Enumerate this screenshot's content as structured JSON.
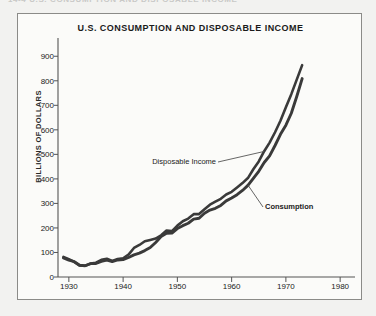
{
  "page": {
    "clipped_header_text": "14-4   U.S. CONSUMPTION AND DISPOSABLE INCOME",
    "background_color": "#f2f2f0",
    "panel_color": "#fbfbf9",
    "frame_color": "#8b8b88",
    "ink_color": "#3a3a3a"
  },
  "chart_data": {
    "type": "line",
    "title": "U.S. CONSUMPTION AND DISPOSABLE INCOME",
    "xlabel": "",
    "ylabel": "BILLIONS OF DOLLARS",
    "xlim": [
      1928,
      1982
    ],
    "ylim": [
      0,
      950
    ],
    "grid": false,
    "legend_position": "inline-annotations",
    "xticks": [
      1930,
      1940,
      1950,
      1960,
      1970,
      1980
    ],
    "xtick_labels": [
      "1930",
      "1940",
      "1950",
      "1960",
      "1970",
      "1980"
    ],
    "yticks": [
      0,
      100,
      200,
      300,
      400,
      500,
      600,
      700,
      800,
      900
    ],
    "ytick_labels": [
      "0",
      "100",
      "200",
      "300",
      "400",
      "500",
      "600",
      "700",
      "800",
      "900"
    ],
    "annotations": [
      {
        "text": "Disposable Income",
        "series": "Disposable Income",
        "bold": false
      },
      {
        "text": "Consumption",
        "series": "Consumption",
        "bold": true
      }
    ],
    "x": [
      1929,
      1930,
      1931,
      1932,
      1933,
      1934,
      1935,
      1936,
      1937,
      1938,
      1939,
      1940,
      1941,
      1942,
      1943,
      1944,
      1945,
      1946,
      1947,
      1948,
      1949,
      1950,
      1951,
      1952,
      1953,
      1954,
      1955,
      1956,
      1957,
      1958,
      1959,
      1960,
      1961,
      1962,
      1963,
      1964,
      1965,
      1966,
      1967,
      1968,
      1969,
      1970,
      1971,
      1972,
      1973
    ],
    "series": [
      {
        "name": "Disposable Income",
        "values": [
          83,
          75,
          60,
          48,
          46,
          52,
          59,
          68,
          72,
          66,
          71,
          76,
          93,
          117,
          133,
          147,
          151,
          160,
          170,
          189,
          189,
          207,
          227,
          238,
          253,
          257,
          275,
          293,
          309,
          318,
          337,
          350,
          364,
          385,
          405,
          438,
          473,
          512,
          546,
          591,
          634,
          691,
          746,
          802,
          865
        ]
      },
      {
        "name": "Consumption",
        "values": [
          79,
          71,
          61,
          49,
          46,
          52,
          56,
          62,
          67,
          64,
          67,
          71,
          81,
          89,
          100,
          109,
          120,
          144,
          165,
          178,
          181,
          195,
          209,
          219,
          233,
          240,
          259,
          271,
          282,
          291,
          311,
          325,
          335,
          355,
          375,
          401,
          433,
          466,
          492,
          537,
          579,
          618,
          668,
          733,
          810
        ]
      }
    ]
  }
}
